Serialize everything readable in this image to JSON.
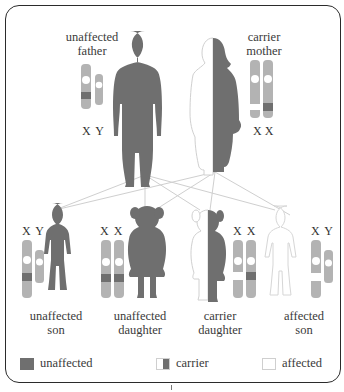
{
  "colors": {
    "unaffected": "#6f6f6f",
    "chromosome": "#b3b3b3",
    "outline": "#d0d0d0",
    "line": "#cfcfcf",
    "frame": "#2b2b2b"
  },
  "parents": {
    "father": {
      "line1": "unaffected",
      "line2": "father",
      "chromosomes": "X Y",
      "status": "unaffected"
    },
    "mother": {
      "line1": "carrier",
      "line2": "mother",
      "chromosomes": "X X",
      "status": "carrier"
    }
  },
  "children": [
    {
      "line1": "unaffected",
      "line2": "son",
      "chromosomes": "X Y",
      "status": "unaffected"
    },
    {
      "line1": "unaffected",
      "line2": "daughter",
      "chromosomes": "X X",
      "status": "unaffected"
    },
    {
      "line1": "carrier",
      "line2": "daughter",
      "chromosomes": "X X",
      "status": "carrier"
    },
    {
      "line1": "affected",
      "line2": "son",
      "chromosomes": "X Y",
      "status": "affected"
    }
  ],
  "legend": {
    "unaffected": "unaffected",
    "carrier": "carrier",
    "affected": "affected"
  }
}
